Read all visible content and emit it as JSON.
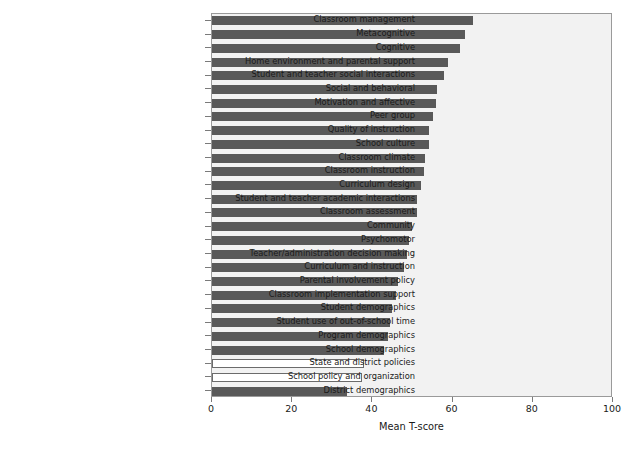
{
  "chart_data": {
    "type": "bar",
    "orientation": "horizontal",
    "title": "",
    "xlabel": "Mean T-score",
    "ylabel": "",
    "xlim": [
      0,
      100
    ],
    "xticks": [
      0,
      20,
      40,
      60,
      80,
      100
    ],
    "xtick_labels": [
      "0",
      "20",
      "40",
      "60",
      "80",
      "100"
    ],
    "grid": false,
    "legend": null,
    "categories": [
      "Classroom management",
      "Metacognitive",
      "Cognitive",
      "Home environment and parental support",
      "Student and teacher social interactions",
      "Social and behavioral",
      "Motivation and affective",
      "Peer group",
      "Quality of instruction",
      "School culture",
      "Classroom climate",
      "Classroom instruction",
      "Curriculum design",
      "Student and teacher academic interactions",
      "Classroom assessment",
      "Community",
      "Psychomotor",
      "Teacher/administration decision making",
      "Curriculum and instruction",
      "Parental involvement policy",
      "Classroom implementation support",
      "Student demographics",
      "Student use of out-of-school time",
      "Program demographics",
      "School demographics",
      "State and district policies",
      "School policy and organization",
      "District demographics"
    ],
    "values": [
      65.2,
      63.2,
      61.8,
      58.9,
      57.9,
      56.2,
      55.8,
      55.0,
      54.2,
      54.0,
      53.0,
      52.8,
      52.2,
      51.2,
      51.0,
      49.8,
      49.2,
      48.6,
      47.8,
      46.4,
      46.0,
      44.8,
      44.4,
      44.0,
      42.8,
      37.8,
      37.4,
      33.6
    ],
    "bar_styles": [
      "filled",
      "filled",
      "filled",
      "filled",
      "filled",
      "filled",
      "filled",
      "filled",
      "filled",
      "filled",
      "filled",
      "filled",
      "filled",
      "filled",
      "filled",
      "filled",
      "filled",
      "filled",
      "filled",
      "filled",
      "filled",
      "filled",
      "filled",
      "filled",
      "filled",
      "open",
      "open",
      "filled"
    ],
    "colors": {
      "bar_filled": "#595959",
      "bar_open_face": "#ffffff",
      "bar_open_edge": "#6b6b6b",
      "plot_background": "#f2f2f2",
      "frame": "#9a9a9a",
      "text": "#1a1a1a"
    }
  }
}
